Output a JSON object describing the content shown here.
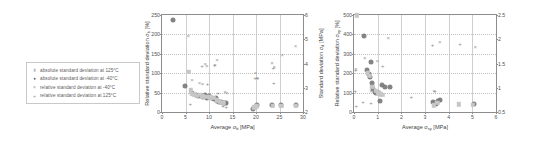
{
  "legend": {
    "items": [
      {
        "marker": "square",
        "label": "absolute standard deviation at 125°C"
      },
      {
        "marker": "circle",
        "label": "absolute standard deviation at -40°C"
      },
      {
        "marker": "cross",
        "label": "relative standard deviation at -40°C"
      },
      {
        "marker": "plus",
        "label": "relative standard deviation at 125°C"
      }
    ]
  },
  "chart_data": [
    {
      "id": "left",
      "type": "scatter",
      "title": "",
      "xlabel": "Average σb [MPa]",
      "ylabel": "Relative standard deviation σb [%]",
      "y2label": "Standard deviation σd [MPa]",
      "xlim": [
        0,
        30
      ],
      "ylim": [
        0,
        250
      ],
      "y2lim": [
        2,
        6
      ],
      "xticks": [
        0,
        5,
        10,
        15,
        20,
        25,
        30
      ],
      "yticks": [
        0,
        50,
        100,
        150,
        200,
        250
      ],
      "y2ticks": [
        2,
        3,
        4,
        5,
        6
      ],
      "grid": true,
      "legend_position": "external-left",
      "series": [
        {
          "name": "absolute standard deviation at -40°C",
          "marker": "circle",
          "points": [
            [
              2.4,
              237
            ],
            [
              4.9,
              68
            ],
            [
              6.3,
              48
            ],
            [
              7.2,
              43
            ],
            [
              7.6,
              40
            ],
            [
              8.3,
              41
            ],
            [
              8.8,
              38
            ],
            [
              9.2,
              44
            ],
            [
              9.6,
              36
            ],
            [
              10.1,
              40
            ],
            [
              10.6,
              37
            ],
            [
              11.0,
              33
            ],
            [
              11.4,
              35
            ],
            [
              11.8,
              28
            ],
            [
              12.1,
              26
            ],
            [
              12.5,
              25
            ],
            [
              12.9,
              24
            ],
            [
              13.3,
              23
            ],
            [
              13.6,
              22
            ],
            [
              19.4,
              9
            ],
            [
              20.3,
              17
            ],
            [
              23.5,
              17
            ],
            [
              25.3,
              17
            ],
            [
              28.6,
              17
            ]
          ]
        },
        {
          "name": "absolute standard deviation at 125°C",
          "marker": "square",
          "points": [
            [
              5.7,
              103
            ],
            [
              6.1,
              56
            ],
            [
              6.4,
              47
            ],
            [
              6.9,
              44
            ],
            [
              7.4,
              42
            ],
            [
              8.0,
              45
            ],
            [
              8.6,
              40
            ],
            [
              9.4,
              39
            ],
            [
              10.2,
              38
            ],
            [
              10.9,
              36
            ],
            [
              11.6,
              30
            ],
            [
              12.3,
              27
            ],
            [
              12.8,
              24
            ],
            [
              13.1,
              23
            ],
            [
              19.6,
              12
            ],
            [
              20.1,
              15
            ],
            [
              23.6,
              16
            ],
            [
              25.4,
              16
            ],
            [
              28.5,
              16
            ]
          ]
        },
        {
          "name": "relative standard deviation at -40°C",
          "marker": "cross",
          "points": [
            [
              5.6,
              197
            ],
            [
              6.4,
              83
            ],
            [
              8.0,
              74
            ],
            [
              8.6,
              71
            ],
            [
              9.2,
              125
            ],
            [
              9.5,
              118
            ],
            [
              11.3,
              121
            ],
            [
              11.7,
              133
            ],
            [
              13.4,
              51
            ],
            [
              13.8,
              50
            ],
            [
              19.9,
              101
            ],
            [
              20.2,
              88
            ],
            [
              23.4,
              127
            ],
            [
              23.9,
              116
            ],
            [
              25.6,
              147
            ],
            [
              28.4,
              171
            ]
          ]
        },
        {
          "name": "relative standard deviation at 125°C",
          "marker": "plus",
          "points": [
            [
              6.0,
              21
            ],
            [
              8.5,
              118
            ],
            [
              9.7,
              72
            ],
            [
              11.2,
              120
            ],
            [
              11.9,
              50
            ],
            [
              13.0,
              15
            ],
            [
              13.7,
              12
            ],
            [
              19.8,
              88
            ],
            [
              20.4,
              87
            ],
            [
              23.7,
              114
            ],
            [
              23.8,
              74
            ]
          ]
        }
      ]
    },
    {
      "id": "right",
      "type": "scatter",
      "title": "",
      "xlabel": "Average σxy [MPa]",
      "ylabel": "Relative standard deviation σxy [%]",
      "y2label": "",
      "xlim": [
        0,
        6
      ],
      "ylim": [
        0,
        500
      ],
      "y2lim": [
        0.5,
        2.5
      ],
      "xticks": [
        0,
        1,
        2,
        3,
        4,
        5,
        6
      ],
      "yticks": [
        0,
        100,
        200,
        300,
        400,
        500
      ],
      "y2ticks": [
        0.5,
        1,
        1.5,
        2,
        2.5
      ],
      "grid": true,
      "legend_position": "external-left",
      "series": [
        {
          "name": "absolute standard deviation at -40°C",
          "marker": "circle",
          "points": [
            [
              0.42,
              393
            ],
            [
              0.72,
              258
            ],
            [
              0.55,
              214
            ],
            [
              0.62,
              196
            ],
            [
              0.68,
              178
            ],
            [
              0.75,
              152
            ],
            [
              0.82,
              120
            ],
            [
              0.88,
              104
            ],
            [
              0.95,
              97
            ],
            [
              1.05,
              98
            ],
            [
              1.18,
              140
            ],
            [
              1.32,
              131
            ],
            [
              1.52,
              128
            ],
            [
              1.08,
              55
            ],
            [
              3.35,
              52
            ],
            [
              3.42,
              47
            ],
            [
              3.48,
              42
            ],
            [
              3.55,
              58
            ],
            [
              3.62,
              63
            ],
            [
              5.05,
              40
            ]
          ]
        },
        {
          "name": "absolute standard deviation at 125°C",
          "marker": "square",
          "points": [
            [
              0.12,
              498
            ],
            [
              0.58,
              200
            ],
            [
              0.66,
              186
            ],
            [
              0.78,
              130
            ],
            [
              0.92,
              110
            ],
            [
              1.02,
              96
            ],
            [
              1.12,
              92
            ],
            [
              1.22,
              88
            ],
            [
              3.38,
              35
            ],
            [
              3.52,
              46
            ],
            [
              4.42,
              40
            ],
            [
              5.02,
              38
            ]
          ]
        },
        {
          "name": "relative standard deviation at -40°C",
          "marker": "cross",
          "points": [
            [
              0.08,
              222
            ],
            [
              0.45,
              277
            ],
            [
              0.72,
              110
            ],
            [
              0.98,
              262
            ],
            [
              1.45,
              380
            ],
            [
              3.38,
              108
            ],
            [
              3.62,
              360
            ],
            [
              5.12,
              336
            ]
          ]
        },
        {
          "name": "relative standard deviation at 125°C",
          "marker": "plus",
          "points": [
            [
              0.06,
              215
            ],
            [
              0.05,
              110
            ],
            [
              0.1,
              32
            ],
            [
              0.38,
              52
            ],
            [
              0.72,
              46
            ],
            [
              1.22,
              238
            ],
            [
              2.42,
              78
            ],
            [
              3.32,
              344
            ],
            [
              3.42,
              108
            ],
            [
              4.48,
              348
            ]
          ]
        }
      ]
    }
  ]
}
